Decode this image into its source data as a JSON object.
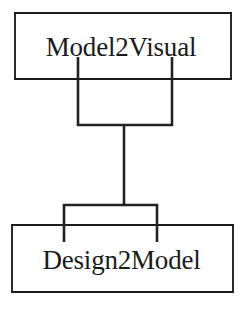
{
  "diagram": {
    "type": "class-hierarchy",
    "orientation": "vertical",
    "background_color": "#ffffff",
    "line_color": "#232323",
    "text_color": "#1a1a1a",
    "nodes": [
      {
        "id": "model2visual",
        "label": "Model2Visual",
        "position": "top"
      },
      {
        "id": "design2model",
        "label": "Design2Model",
        "position": "bottom"
      }
    ],
    "edges": [
      {
        "id": "model2visual-to-design2model",
        "from": "model2visual",
        "to": "design2model",
        "style": "bracket-tree"
      }
    ]
  }
}
